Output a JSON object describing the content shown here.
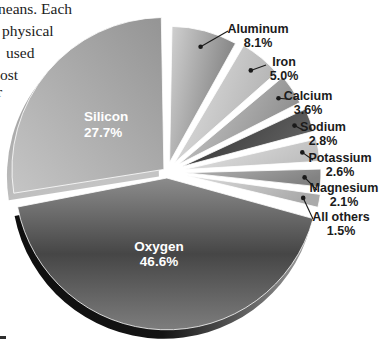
{
  "page": {
    "background": "#ffffff",
    "figure_type": "textbook pie chart scan (grayscale)"
  },
  "left_text": {
    "description": "cropped right edge of a paragraph from the page",
    "lines": [
      "neans. Each",
      "physical",
      "used",
      "ost",
      "r"
    ]
  },
  "bottom_fragment": "-",
  "chart_data": {
    "type": "pie",
    "title": "",
    "unit": "%",
    "total": 100.0,
    "legend_position": "none",
    "style": "3D exploded pie, grayscale, external leader-line labels on right, internal white labels for two largest slices",
    "categories": [
      "Aluminum",
      "Iron",
      "Calcium",
      "Sodium",
      "Potassium",
      "Magnesium",
      "All others",
      "Oxygen",
      "Silicon"
    ],
    "values": [
      8.1,
      5.0,
      3.6,
      2.8,
      2.6,
      2.1,
      1.5,
      46.6,
      27.7
    ],
    "layout": {
      "cx": 167,
      "cy": 172,
      "dot_radius": 2.3,
      "dot_dist_factor": 0.88,
      "line_color": "#1a1a1a"
    },
    "slices": [
      {
        "key": "aluminum",
        "name": "Aluminum",
        "value": 8.1,
        "pct": "8.1%",
        "start": 1,
        "end": 29,
        "r": 136,
        "explode": 10,
        "grad": {
          "x1": 0,
          "y1": 0,
          "x2": 1,
          "y2": 0.4,
          "stops": [
            "#d2d2d2",
            "#7e7e7e"
          ]
        },
        "label_pos": "external",
        "label_x": 258,
        "label_y1": 33,
        "label_y2": 47,
        "line_end": [
          228,
          31
        ]
      },
      {
        "key": "iron",
        "name": "Iron",
        "value": 5.0,
        "pct": "5.0%",
        "start": 30.5,
        "end": 48.5,
        "r": 136,
        "explode": 12,
        "grad": {
          "x1": 0,
          "y1": 0,
          "x2": 1,
          "y2": 0.4,
          "stops": [
            "#e4e4e4",
            "#b2b2b2"
          ]
        },
        "label_pos": "external",
        "label_x": 284,
        "label_y1": 66,
        "label_y2": 80,
        "line_end": [
          266,
          65
        ]
      },
      {
        "key": "calcium",
        "name": "Calcium",
        "value": 3.6,
        "pct": "3.6%",
        "start": 50,
        "end": 63,
        "r": 136,
        "explode": 14,
        "grad": {
          "x1": 0,
          "y1": 0,
          "x2": 1,
          "y2": 0.4,
          "stops": [
            "#d0d0d0",
            "#8d8d8d"
          ]
        },
        "label_pos": "external",
        "label_x": 308,
        "label_y1": 100,
        "label_y2": 114,
        "line_end": [
          287,
          99
        ]
      },
      {
        "key": "sodium",
        "name": "Sodium",
        "value": 2.8,
        "pct": "2.8%",
        "start": 65,
        "end": 75,
        "r": 136,
        "explode": 16,
        "grad": {
          "x1": 0,
          "y1": 0,
          "x2": 1,
          "y2": 0.4,
          "stops": [
            "#2d2d2d",
            "#616161"
          ]
        },
        "label_pos": "external",
        "label_x": 323,
        "label_y1": 131,
        "label_y2": 145,
        "line_end": [
          301,
          129
        ]
      },
      {
        "key": "potassium",
        "name": "Potassium",
        "value": 2.6,
        "pct": "2.6%",
        "start": 77,
        "end": 86.5,
        "r": 136,
        "explode": 17,
        "grad": {
          "x1": 0,
          "y1": 0,
          "x2": 1,
          "y2": 0.4,
          "stops": [
            "#e7e7e7",
            "#bfbfbf"
          ]
        },
        "label_pos": "external",
        "label_x": 340,
        "label_y1": 162,
        "label_y2": 176,
        "line_end": [
          313,
          160
        ]
      },
      {
        "key": "magnesium",
        "name": "Magnesium",
        "value": 2.1,
        "pct": "2.1%",
        "start": 88.5,
        "end": 96,
        "r": 136,
        "explode": 18,
        "grad": {
          "x1": 0,
          "y1": 0,
          "x2": 1,
          "y2": 0.4,
          "stops": [
            "#b2b2b2",
            "#828282"
          ]
        },
        "label_pos": "external",
        "label_x": 344,
        "label_y1": 192,
        "label_y2": 206,
        "line_end": [
          317,
          190
        ]
      },
      {
        "key": "all-others",
        "name": "All others",
        "value": 1.5,
        "pct": "1.5%",
        "start": 98,
        "end": 103.5,
        "r": 136,
        "explode": 19,
        "grad": {
          "x1": 0,
          "y1": 0,
          "x2": 1,
          "y2": 0.4,
          "stops": [
            "#dddddd",
            "#aaaaaa"
          ]
        },
        "label_pos": "external",
        "label_x": 341,
        "label_y1": 221,
        "label_y2": 235,
        "line_end": [
          313,
          219
        ]
      },
      {
        "key": "oxygen",
        "name": "Oxygen",
        "value": 46.6,
        "pct": "46.6%",
        "start": 105.5,
        "end": 259,
        "r": 152,
        "explode": 6,
        "grad": {
          "x1": 0,
          "y1": 0,
          "x2": 0,
          "y2": 1,
          "stops": [
            "#8c8c8c",
            "#464646",
            "#7d7d7d"
          ]
        },
        "depth": {
          "dx": -3,
          "dy": 9,
          "grad": {
            "x1": 0,
            "y1": 0,
            "x2": 1,
            "y2": 0,
            "stops": [
              "#0f0f0f",
              "#141414",
              "#9c9c9c"
            ]
          }
        },
        "label_pos": "internal",
        "label_x": 159,
        "label_y1": 251,
        "label_y2": 266
      },
      {
        "key": "silicon",
        "name": "Silicon",
        "value": 27.7,
        "pct": "27.7%",
        "start": 261,
        "end": 359,
        "r": 152,
        "explode": 4,
        "grad": {
          "x1": 0,
          "y1": 1,
          "x2": 1,
          "y2": 0,
          "stops": [
            "#c5c5c5",
            "#949494"
          ]
        },
        "depth": {
          "dx": -5,
          "dy": 7,
          "grad": {
            "x1": 0,
            "y1": 0,
            "x2": 0.3,
            "y2": 1,
            "stops": [
              "#8b8b8b",
              "#c4c4c4"
            ]
          }
        },
        "label_pos": "internal",
        "label_x": 84,
        "label_y1": 121,
        "label_y2": 137,
        "label_align": "start"
      }
    ]
  }
}
